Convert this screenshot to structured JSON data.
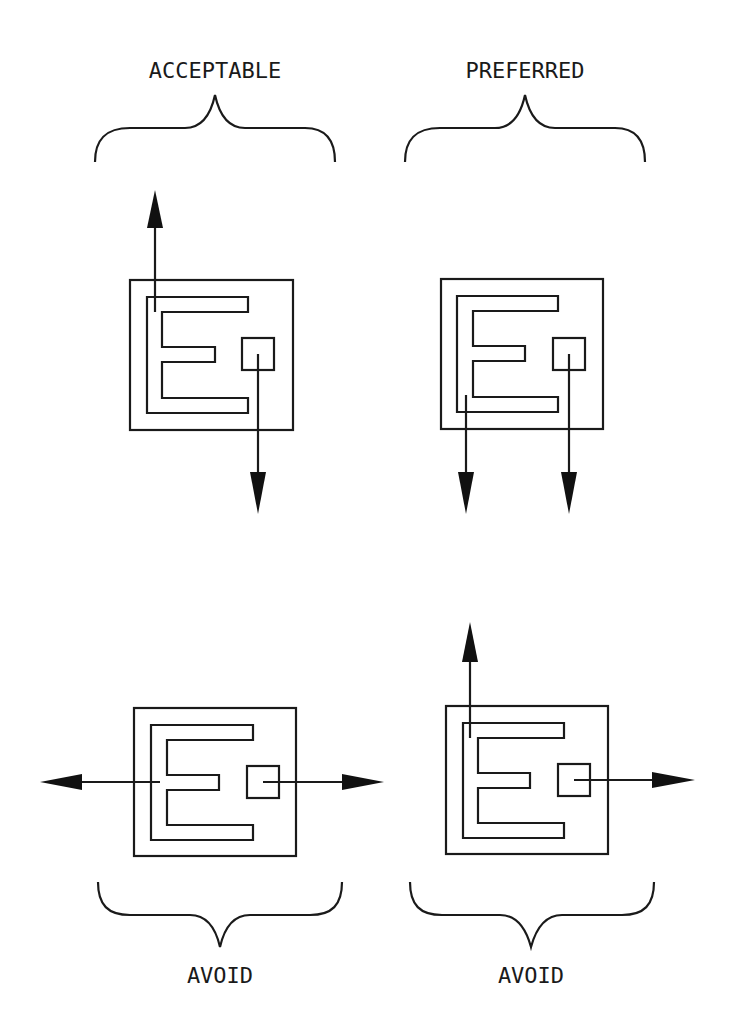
{
  "diagram": {
    "colors": {
      "line": "#1a1a1a",
      "arrowhead": "#111111",
      "background": "#ffffff"
    },
    "panels": [
      {
        "id": "top-left",
        "label": "ACCEPTABLE",
        "brace_position": "above",
        "leads": [
          {
            "from": "E-top-left",
            "direction": "up"
          },
          {
            "from": "square-pad",
            "direction": "down"
          }
        ]
      },
      {
        "id": "top-right",
        "label": "PREFERRED",
        "brace_position": "above",
        "leads": [
          {
            "from": "E-bottom-left",
            "direction": "down"
          },
          {
            "from": "square-pad",
            "direction": "down"
          }
        ]
      },
      {
        "id": "bottom-left",
        "label": "AVOID",
        "brace_position": "below",
        "leads": [
          {
            "from": "E-middle-left",
            "direction": "left"
          },
          {
            "from": "square-pad",
            "direction": "right"
          }
        ]
      },
      {
        "id": "bottom-right",
        "label": "AVOID",
        "brace_position": "below",
        "leads": [
          {
            "from": "E-top-left",
            "direction": "up"
          },
          {
            "from": "square-pad",
            "direction": "right"
          }
        ]
      }
    ]
  }
}
